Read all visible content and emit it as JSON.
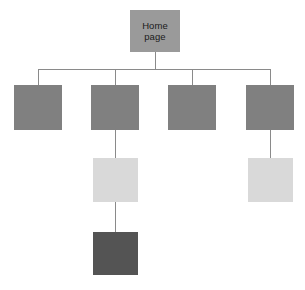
{
  "diagram": {
    "type": "sitemap-tree",
    "canvas": {
      "width": 305,
      "height": 290,
      "background": "#ffffff"
    },
    "palette": {
      "root": "#9a9a9a",
      "level1": "#808080",
      "level2": "#d9d9d9",
      "level3": "#545454",
      "connector": "#8a8a8a",
      "label_text": "#1a1a1a"
    },
    "root_node": {
      "label": "Home\npage",
      "color": "#9a9a9a",
      "x": 130,
      "y": 10,
      "width": 50,
      "height": 42
    },
    "levels": [
      {
        "name": "level-1",
        "color": "#808080",
        "y": 85,
        "width": 48,
        "height": 45,
        "nodes": [
          {
            "label": "",
            "center_x": 38,
            "has_child": false
          },
          {
            "label": "",
            "center_x": 115,
            "has_child": true
          },
          {
            "label": "",
            "center_x": 192,
            "has_child": false
          },
          {
            "label": "",
            "center_x": 270,
            "has_child": true
          }
        ]
      },
      {
        "name": "level-2",
        "color": "#d9d9d9",
        "y": 158,
        "width": 45,
        "height": 44,
        "nodes": [
          {
            "label": "",
            "center_x": 115,
            "has_child": true
          },
          {
            "label": "",
            "center_x": 270,
            "has_child": false
          }
        ]
      },
      {
        "name": "level-3",
        "color": "#545454",
        "y": 232,
        "width": 45,
        "height": 43,
        "nodes": [
          {
            "label": "",
            "center_x": 115,
            "has_child": false
          }
        ]
      }
    ],
    "bus": {
      "y": 69,
      "x_start": 38,
      "x_end": 270
    }
  }
}
